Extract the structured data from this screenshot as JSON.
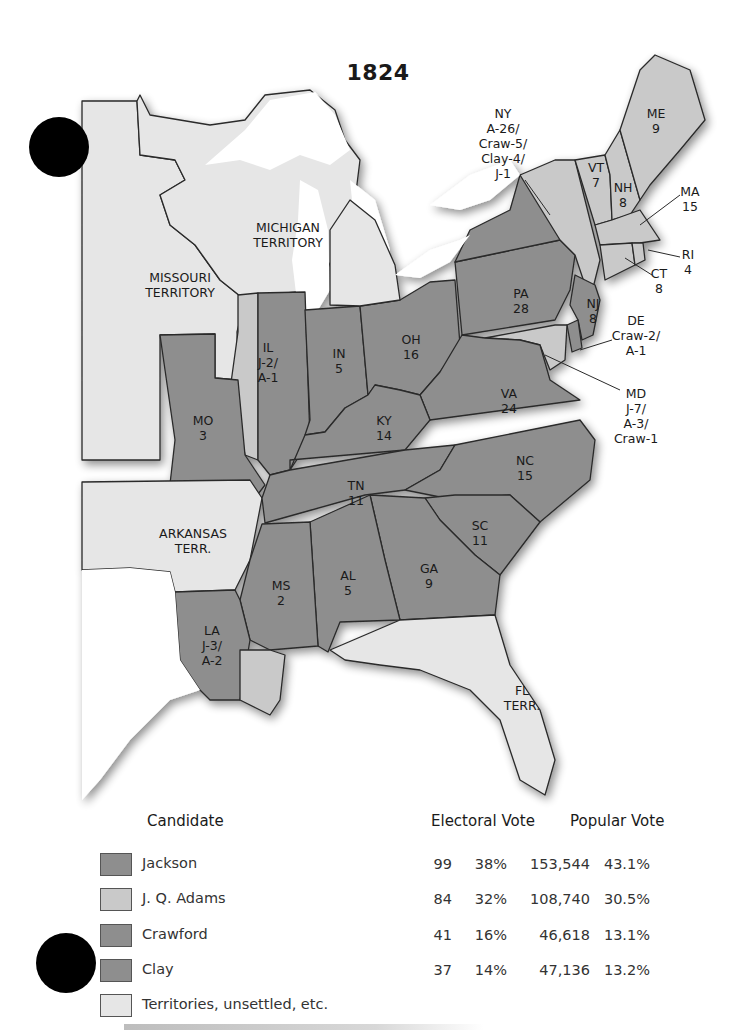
{
  "title": "1824",
  "colors": {
    "jackson": "#8e8e8e",
    "adams": "#c9c9c9",
    "crawford": "#8e8e8e",
    "clay": "#8e8e8e",
    "territory": "#e6e6e6",
    "border": "#2a2a2a"
  },
  "map_labels": {
    "missouri_territory": [
      "MISSOURI",
      "TERRITORY"
    ],
    "michigan_territory": [
      "MICHIGAN",
      "TERRITORY"
    ],
    "arkansas_terr": [
      "ARKANSAS",
      "TERR."
    ],
    "fl_terr": [
      "FL",
      "TERR."
    ],
    "ny": [
      "NY",
      "A-26/",
      "Craw-5/",
      "Clay-4/",
      "J-1"
    ],
    "me": [
      "ME",
      "9"
    ],
    "vt": [
      "VT",
      "7"
    ],
    "nh": [
      "NH",
      "8"
    ],
    "ma": [
      "MA",
      "15"
    ],
    "ri": [
      "RI",
      "4"
    ],
    "ct": [
      "CT",
      "8"
    ],
    "pa": [
      "PA",
      "28"
    ],
    "nj": [
      "NJ",
      "8"
    ],
    "de": [
      "DE",
      "Craw-2/",
      "A-1"
    ],
    "md": [
      "MD",
      "J-7/",
      "A-3/",
      "Craw-1"
    ],
    "oh": [
      "OH",
      "16"
    ],
    "in": [
      "IN",
      "5"
    ],
    "il": [
      "IL",
      "J-2/",
      "A-1"
    ],
    "mo": [
      "MO",
      "3"
    ],
    "ky": [
      "KY",
      "14"
    ],
    "va": [
      "VA",
      "24"
    ],
    "tn": [
      "TN",
      "11"
    ],
    "nc": [
      "NC",
      "15"
    ],
    "sc": [
      "SC",
      "11"
    ],
    "ga": [
      "GA",
      "9"
    ],
    "al": [
      "AL",
      "5"
    ],
    "ms": [
      "MS",
      "2"
    ],
    "la": [
      "LA",
      "J-3/",
      "A-2"
    ]
  },
  "legend": {
    "headers": {
      "candidate": "Candidate",
      "electoral": "Electoral Vote",
      "popular": "Popular Vote"
    },
    "rows": [
      {
        "name": "Jackson",
        "ev": "99",
        "ev_pct": "38%",
        "pv": "153,544",
        "pv_pct": "43.1%"
      },
      {
        "name": "J. Q. Adams",
        "ev": "84",
        "ev_pct": "32%",
        "pv": "108,740",
        "pv_pct": "30.5%"
      },
      {
        "name": "Crawford",
        "ev": "41",
        "ev_pct": "16%",
        "pv": "46,618",
        "pv_pct": "13.1%"
      },
      {
        "name": "Clay",
        "ev": "37",
        "ev_pct": "14%",
        "pv": "47,136",
        "pv_pct": "13.2%"
      },
      {
        "name": "Territories, unsettled, etc.",
        "ev": "",
        "ev_pct": "",
        "pv": "",
        "pv_pct": ""
      }
    ]
  }
}
